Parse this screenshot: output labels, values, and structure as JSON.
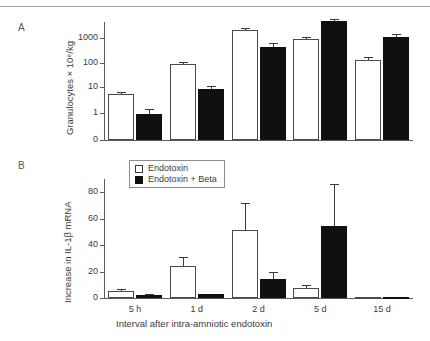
{
  "figure": {
    "panels": [
      {
        "letter": "A"
      },
      {
        "letter": "B"
      }
    ]
  },
  "legend": {
    "position": "top-left-inside-panel-b",
    "entries": [
      {
        "label": "Endotoxin",
        "style": "open",
        "color": "#ffffff"
      },
      {
        "label": "Endotoxin + Beta",
        "style": "filled",
        "color": "#101010"
      }
    ]
  },
  "chart_data": [
    {
      "type": "bar",
      "panel": "A",
      "title": "",
      "xlabel": "",
      "ylabel": "Granulocytes × 10⁶/kg",
      "yscale": "log",
      "ylim": [
        0,
        1000
      ],
      "ytick_labels": [
        "0",
        "1",
        "10",
        "100",
        "1000"
      ],
      "ytick_values": [
        0,
        1,
        10,
        100,
        1000
      ],
      "grid": false,
      "categories": [
        "5 h",
        "1 d",
        "2 d",
        "5 d",
        "15 d"
      ],
      "categories_shown": false,
      "legend_position": "none",
      "series": [
        {
          "name": "Endotoxin",
          "style": "open",
          "values": [
            5.5,
            88,
            2000,
            900,
            130
          ],
          "errors_upper": [
            7.0,
            105,
            2400,
            1100,
            170
          ],
          "errors_lower": [
            4.4,
            72,
            1700,
            740,
            100
          ]
        },
        {
          "name": "Endotoxin + Beta",
          "style": "filled",
          "values": [
            0.95,
            9.5,
            450,
            5000,
            1100
          ],
          "errors_upper": [
            1.45,
            12.5,
            620,
            5600,
            1400
          ],
          "errors_lower": [
            0.62,
            7.4,
            330,
            4400,
            870
          ]
        }
      ]
    },
    {
      "type": "bar",
      "panel": "B",
      "title": "",
      "xlabel": "Interval after intra-amniotic endotoxin",
      "ylabel": "Increase in IL-1β mRNA",
      "yscale": "linear",
      "ylim": [
        0,
        88
      ],
      "ytick_labels": [
        "0",
        "20",
        "40",
        "60",
        "80"
      ],
      "ytick_values": [
        0,
        20,
        40,
        60,
        80
      ],
      "grid": false,
      "categories": [
        "5 h",
        "1 d",
        "2 d",
        "5 d",
        "15 d"
      ],
      "categories_shown": true,
      "legend_position": "upper-left",
      "series": [
        {
          "name": "Endotoxin",
          "style": "open",
          "values": [
            5.0,
            24.5,
            51.5,
            7.5,
            0.5
          ],
          "errors_upper": [
            6.5,
            31.0,
            72.0,
            10.0,
            0.5
          ],
          "errors_lower": [
            5.0,
            24.5,
            51.5,
            7.5,
            0.5
          ]
        },
        {
          "name": "Endotoxin + Beta",
          "style": "filled",
          "values": [
            2.5,
            3.0,
            14.5,
            54.5,
            0.6
          ],
          "errors_upper": [
            3.0,
            3.0,
            20.0,
            86.0,
            0.6
          ],
          "errors_lower": [
            2.5,
            3.0,
            14.5,
            54.5,
            0.6
          ]
        }
      ]
    }
  ]
}
